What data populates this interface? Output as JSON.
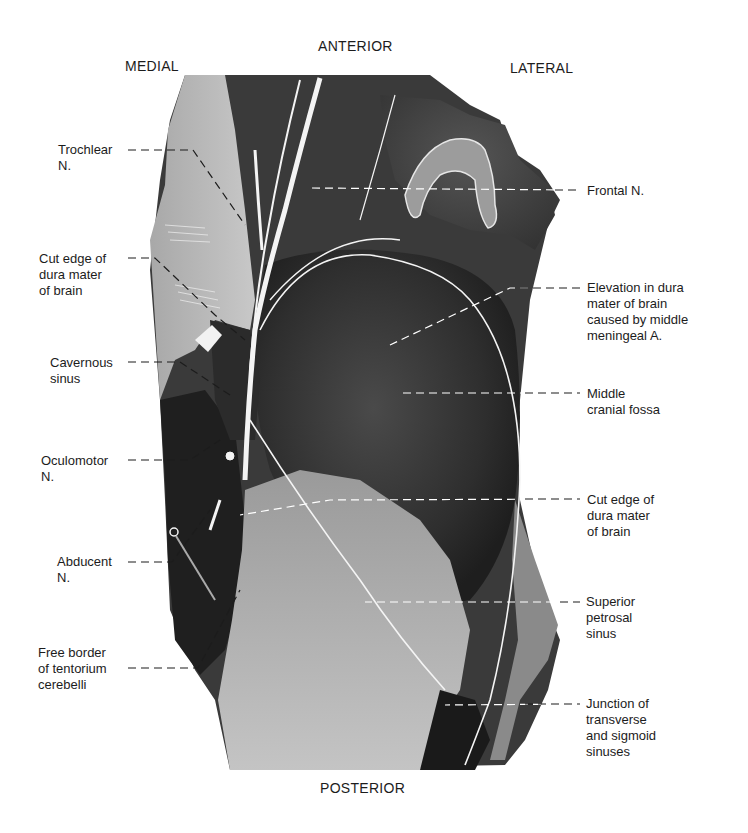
{
  "orientation": {
    "anterior": "ANTERIOR",
    "posterior": "POSTERIOR",
    "medial": "MEDIAL",
    "lateral": "LATERAL"
  },
  "labels_left": [
    {
      "id": "trochlear",
      "text": "Trochlear\nN."
    },
    {
      "id": "cut-edge-dura-left",
      "text": "Cut edge of\ndura mater\nof brain"
    },
    {
      "id": "cavernous-sinus",
      "text": "Cavernous\nsinus"
    },
    {
      "id": "oculomotor",
      "text": "Oculomotor\nN."
    },
    {
      "id": "abducent",
      "text": "Abducent\nN."
    },
    {
      "id": "free-border-tentorium",
      "text": "Free border\nof tentorium\ncerebelli"
    }
  ],
  "labels_right": [
    {
      "id": "frontal",
      "text": "Frontal N."
    },
    {
      "id": "elevation-dura",
      "text": "Elevation in dura\nmater of brain\ncaused by middle\nmeningeal A."
    },
    {
      "id": "middle-cranial-fossa",
      "text": "Middle\ncranial fossa"
    },
    {
      "id": "cut-edge-dura-right",
      "text": "Cut edge of\ndura mater\nof brain"
    },
    {
      "id": "superior-petrosal-sinus",
      "text": "Superior\npetrosal\nsinus"
    },
    {
      "id": "junction-sinuses",
      "text": "Junction of\ntransverse\nand sigmoid\nsinuses"
    }
  ],
  "colors": {
    "background": "#ffffff",
    "text": "#1c1c1c",
    "photo_dark": "#2a2a2a",
    "photo_mid": "#6e6e6e",
    "photo_light": "#b9b9b9",
    "leader_line": "#1c1c1c",
    "leader_line_on_photo": "#ffffff"
  }
}
